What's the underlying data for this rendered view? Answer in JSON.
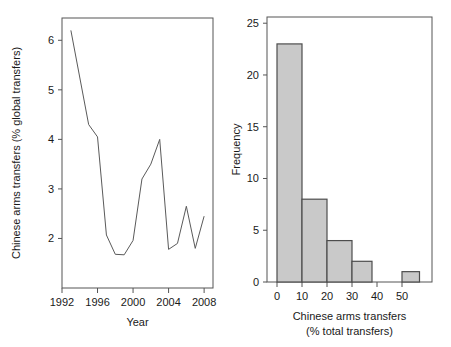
{
  "figure": {
    "background": "#ffffff",
    "line_color": "#5a5a5a",
    "bar_fill": "#c9c9c9",
    "bar_stroke": "#4d4d4d",
    "axis_color": "#555555",
    "text_color": "#1a1a1a"
  },
  "chart_data": [
    {
      "type": "line",
      "panel": "left",
      "title": "",
      "xlabel": "Year",
      "ylabel": "Chinese arms transfers (% global transfers)",
      "xlim": [
        1992,
        2009
      ],
      "ylim": [
        1.0,
        6.45
      ],
      "xticks": [
        1992,
        1996,
        2000,
        2004,
        2008
      ],
      "xtick_labels": [
        "1992",
        "1996",
        "2000",
        "2004",
        "2008"
      ],
      "yticks": [
        2,
        3,
        4,
        5,
        6
      ],
      "ytick_labels": [
        "2",
        "3",
        "4",
        "5",
        "6"
      ],
      "grid": false,
      "legend": "none",
      "x": [
        1993,
        1995,
        1996,
        1997,
        1998,
        1999,
        2000,
        2001,
        2002,
        2003,
        2004,
        2005,
        2006,
        2007,
        2008
      ],
      "values": [
        6.2,
        4.3,
        4.05,
        2.07,
        1.68,
        1.67,
        1.96,
        3.2,
        3.5,
        4.0,
        1.78,
        1.9,
        2.65,
        1.8,
        2.45
      ]
    },
    {
      "type": "bar",
      "panel": "right",
      "title": "",
      "xlabel": "Chinese arms transfers",
      "xlabel2": "(% total transfers)",
      "ylabel": "Frequency",
      "xlim": [
        -4,
        62
      ],
      "ylim": [
        0,
        25.6
      ],
      "xticks": [
        0,
        10,
        20,
        30,
        40,
        50
      ],
      "xtick_labels": [
        "0",
        "10",
        "20",
        "30",
        "40",
        "50"
      ],
      "yticks": [
        0,
        5,
        10,
        15,
        20,
        25
      ],
      "ytick_labels": [
        "0",
        "5",
        "10",
        "15",
        "20",
        "25"
      ],
      "grid": false,
      "legend": "none",
      "bin_edges": [
        0,
        10,
        20,
        30,
        38,
        50,
        57
      ],
      "categories": [
        "0-10",
        "10-20",
        "20-30",
        "30-38",
        "38-50",
        "50-57"
      ],
      "bars": [
        {
          "left": 0,
          "right": 10,
          "value": 23
        },
        {
          "left": 10,
          "right": 20,
          "value": 8
        },
        {
          "left": 20,
          "right": 30,
          "value": 4
        },
        {
          "left": 30,
          "right": 38,
          "value": 2
        },
        {
          "left": 38,
          "right": 50,
          "value": 0
        },
        {
          "left": 50,
          "right": 57,
          "value": 1
        }
      ],
      "values": [
        23,
        8,
        4,
        2,
        0,
        1
      ]
    }
  ]
}
